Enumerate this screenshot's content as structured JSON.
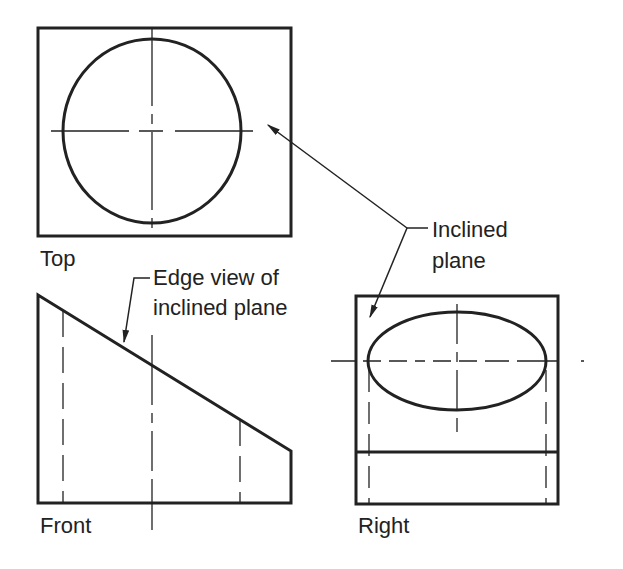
{
  "diagram": {
    "type": "orthographic-projection",
    "views": {
      "top": {
        "label": "Top"
      },
      "front": {
        "label": "Front"
      },
      "right": {
        "label": "Right"
      }
    },
    "annotations": {
      "edge_view": {
        "line1": "Edge view of",
        "line2": "inclined plane"
      },
      "inclined_plane": {
        "line1": "Inclined",
        "line2": "plane"
      }
    },
    "colors": {
      "line": "#222222",
      "background": "#ffffff"
    }
  }
}
